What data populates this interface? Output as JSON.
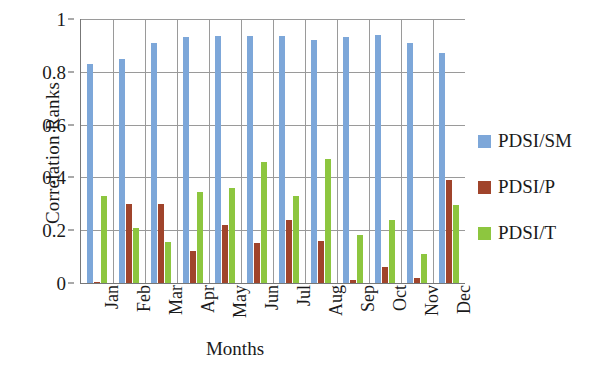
{
  "chart_data": {
    "type": "bar",
    "title": "",
    "xlabel": "Months",
    "ylabel": "Correlation Ranks",
    "ylim": [
      0,
      1
    ],
    "yticks": [
      "0",
      "0.2",
      "0.4",
      "0.6",
      "0.8",
      "1"
    ],
    "ytick_values": [
      0,
      0.2,
      0.4,
      0.6,
      0.8,
      1
    ],
    "grid": true,
    "legend_position": "right",
    "categories": [
      "Jan",
      "Feb",
      "Mar",
      "Apr",
      "May",
      "Jun",
      "Jul",
      "Aug",
      "Sep",
      "Oct",
      "Nov",
      "Dec"
    ],
    "series": [
      {
        "name": "PDSI/SM",
        "color": "#7DA7D9",
        "values": [
          0.83,
          0.85,
          0.91,
          0.93,
          0.935,
          0.935,
          0.935,
          0.92,
          0.93,
          0.94,
          0.91,
          0.87
        ]
      },
      {
        "name": "PDSI/P",
        "color": "#A0442B",
        "values": [
          0.005,
          0.3,
          0.3,
          0.12,
          0.22,
          0.15,
          0.24,
          0.16,
          0.01,
          0.06,
          0.02,
          0.39
        ]
      },
      {
        "name": "PDSI/T",
        "color": "#8DC63F",
        "values": [
          0.33,
          0.21,
          0.155,
          0.345,
          0.36,
          0.46,
          0.33,
          0.47,
          0.18,
          0.24,
          0.11,
          0.295
        ]
      }
    ]
  },
  "legend": {
    "items": [
      {
        "label": "PDSI/SM",
        "color": "#7DA7D9"
      },
      {
        "label": "PDSI/P",
        "color": "#A0442B"
      },
      {
        "label": "PDSI/T",
        "color": "#8DC63F"
      }
    ]
  }
}
